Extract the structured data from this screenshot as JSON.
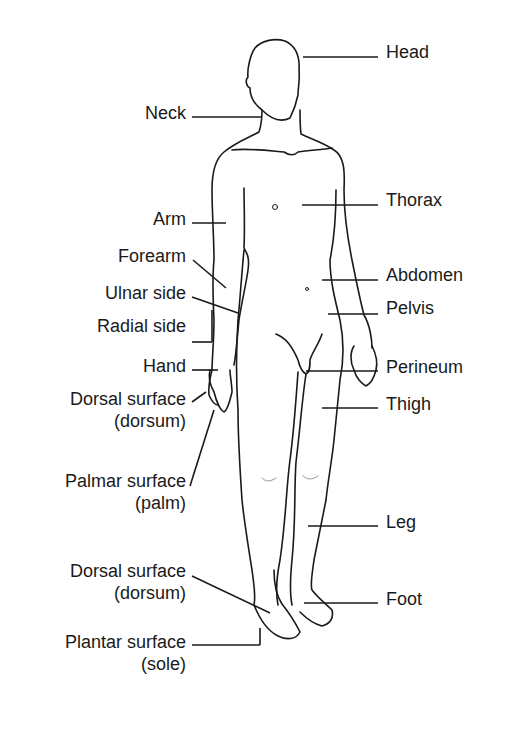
{
  "diagram": {
    "line_color": "#1a1a1a",
    "left_labels": [
      {
        "id": "neck",
        "text": "Neck",
        "x": 186,
        "y": 102
      },
      {
        "id": "arm",
        "text": "Arm",
        "x": 186,
        "y": 208
      },
      {
        "id": "forearm",
        "text": "Forearm",
        "x": 186,
        "y": 245
      },
      {
        "id": "ulnar-side",
        "text": "Ulnar side",
        "x": 186,
        "y": 282
      },
      {
        "id": "radial-side",
        "text": "Radial side",
        "x": 186,
        "y": 315
      },
      {
        "id": "hand",
        "text": "Hand",
        "x": 186,
        "y": 355
      },
      {
        "id": "dorsal-surface-hand",
        "text": "Dorsal surface",
        "sub": "(dorsum)",
        "x": 186,
        "y": 388
      },
      {
        "id": "palmar-surface",
        "text": "Palmar  surface",
        "sub": "(palm)",
        "x": 186,
        "y": 470
      },
      {
        "id": "dorsal-surface-foot",
        "text": "Dorsal surface",
        "sub": "(dorsum)",
        "x": 186,
        "y": 560
      },
      {
        "id": "plantar-surface",
        "text": "Plantar surface",
        "sub": "(sole)",
        "x": 186,
        "y": 631
      }
    ],
    "right_labels": [
      {
        "id": "head",
        "text": "Head",
        "x": 386,
        "y": 41
      },
      {
        "id": "thorax",
        "text": "Thorax",
        "x": 386,
        "y": 189
      },
      {
        "id": "abdomen",
        "text": "Abdomen",
        "x": 386,
        "y": 264
      },
      {
        "id": "pelvis",
        "text": "Pelvis",
        "x": 386,
        "y": 297
      },
      {
        "id": "perineum",
        "text": "Perineum",
        "x": 386,
        "y": 356
      },
      {
        "id": "thigh",
        "text": "Thigh",
        "x": 386,
        "y": 393
      },
      {
        "id": "leg",
        "text": "Leg",
        "x": 386,
        "y": 511
      },
      {
        "id": "foot",
        "text": "Foot",
        "x": 386,
        "y": 588
      }
    ]
  }
}
